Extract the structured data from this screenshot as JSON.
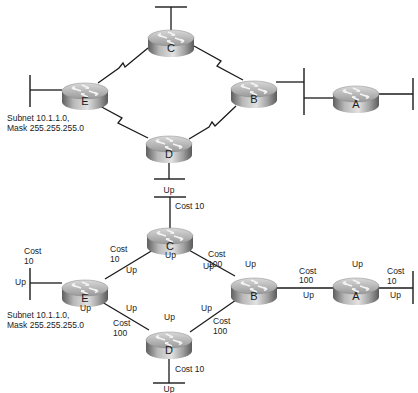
{
  "colors": {
    "line": "#1a1a1a",
    "router_top_light": "#e8e8e8",
    "router_body_mid": "#a9a9a9",
    "router_body_dark": "#6e6e6e",
    "text": "#222222"
  },
  "top_diagram": {
    "routers": [
      {
        "id": "C",
        "label": "C",
        "cx": 171,
        "cy": 42
      },
      {
        "id": "E",
        "label": "E",
        "cx": 85,
        "cy": 95
      },
      {
        "id": "B",
        "label": "B",
        "cx": 254,
        "cy": 93
      },
      {
        "id": "A",
        "label": "A",
        "cx": 356,
        "cy": 98
      },
      {
        "id": "D",
        "label": "D",
        "cx": 169,
        "cy": 148
      }
    ],
    "links": [
      {
        "from": "E",
        "to": "C",
        "type": "serial"
      },
      {
        "from": "C",
        "to": "B",
        "type": "serial"
      },
      {
        "from": "E",
        "to": "D",
        "type": "serial"
      },
      {
        "from": "D",
        "to": "B",
        "type": "serial"
      },
      {
        "from": "B",
        "to": "A",
        "type": "ethernet-segment"
      }
    ],
    "subnet_label_line1": "Subnet 10.1.1.0,",
    "subnet_label_line2": "Mask 255.255.255.0"
  },
  "bottom_diagram": {
    "routers": [
      {
        "id": "C",
        "label": "C",
        "cx": 171,
        "cy": 240
      },
      {
        "id": "E",
        "label": "E",
        "cx": 85,
        "cy": 294
      },
      {
        "id": "B",
        "label": "B",
        "cx": 254,
        "cy": 292
      },
      {
        "id": "A",
        "label": "A",
        "cx": 356,
        "cy": 292
      },
      {
        "id": "D",
        "label": "D",
        "cx": 169,
        "cy": 346
      }
    ],
    "subnet_label_line1": "Subnet 10.1.1.0,",
    "subnet_label_line2": "Mask 255.255.255.0",
    "labels": {
      "c_top_up": "Up",
      "c_top_cost": "Cost 10",
      "e_lan_cost": "Cost",
      "e_lan_cost_val": "10",
      "e_lan_up": "Up",
      "ec_cost": "Cost",
      "ec_cost_val": "10",
      "ec_up_e": "Up",
      "ec_up_c": "Up",
      "cb_cost": "Cost",
      "cb_cost_val": "100",
      "cb_up_c": "Up",
      "cb_up_b": "Up",
      "e_up_under": "Up",
      "ed_up_e": "Up",
      "ed_cost": "Cost",
      "ed_cost_val": "100",
      "ed_up_d": "Up",
      "db_up_d": "Up",
      "db_cost": "Cost",
      "db_cost_val": "100",
      "b_up_top": "Up",
      "ba_cost": "Cost",
      "ba_cost_val": "100",
      "ba_up": "Up",
      "a_up_top": "Up",
      "a_lan_cost": "Cost",
      "a_lan_cost_val": "10",
      "a_lan_up": "Up",
      "d_bottom_cost": "Cost 10",
      "d_bottom_up": "Up"
    }
  },
  "divider_label": "Up"
}
